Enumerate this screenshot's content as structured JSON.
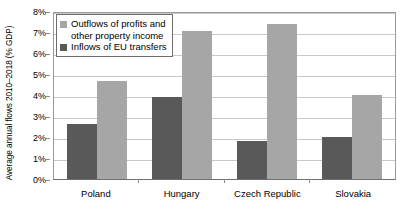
{
  "chart_data": {
    "type": "bar",
    "title": "",
    "xlabel": "",
    "ylabel": "Average annual flows 2010–2018 (% GDP)",
    "ylim": [
      0,
      8
    ],
    "ytick_labels": [
      "8%",
      "7%",
      "6%",
      "5%",
      "4%",
      "3%",
      "2%",
      "1%",
      "0%"
    ],
    "ytick_values": [
      8,
      7,
      6,
      5,
      4,
      3,
      2,
      1,
      0
    ],
    "grid": true,
    "legend_position": "top-left",
    "categories": [
      "Poland",
      "Hungary",
      "Czech Republic",
      "Slovakia"
    ],
    "series": [
      {
        "name": "Inflows of EU transfers",
        "color": "#595959",
        "values": [
          2.6,
          3.9,
          1.8,
          2.0
        ]
      },
      {
        "name": "Outflows of profits and other property income",
        "color": "#a6a6a6",
        "values": [
          4.65,
          7.05,
          7.4,
          4.0
        ]
      }
    ],
    "legend": [
      {
        "label_line1": "Outflows of profits and",
        "label_line2": "other property income",
        "color": "#a6a6a6"
      },
      {
        "label_line1": "Inflows of EU transfers",
        "label_line2": "",
        "color": "#595959"
      }
    ]
  }
}
